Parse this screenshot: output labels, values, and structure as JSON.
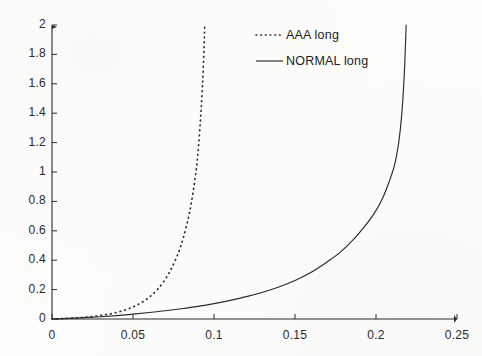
{
  "figure": {
    "background_color": "#fdfdfc",
    "ink_color": "#2b2b2b",
    "width": 482,
    "height": 356
  },
  "chart_data": {
    "type": "line",
    "title": "",
    "subtitle": "",
    "xlabel": "",
    "ylabel": "",
    "xlim": [
      0,
      0.25
    ],
    "ylim": [
      0,
      2
    ],
    "grid": false,
    "legend_position": "top-center",
    "xticks": [
      0,
      0.05,
      0.1,
      0.15,
      0.2,
      0.25
    ],
    "xtick_labels": [
      "0",
      "0.05",
      "0.1",
      "0.15",
      "0.2",
      "0.25"
    ],
    "yticks": [
      0,
      0.2,
      0.4,
      0.6,
      0.8,
      1,
      1.2,
      1.4,
      1.6,
      1.8,
      2
    ],
    "ytick_labels": [
      "0",
      "0.2",
      "0.4",
      "0.6",
      "0.8",
      "1",
      "1.2",
      "1.4",
      "1.6",
      "1.8",
      "2"
    ],
    "series": [
      {
        "name": "AAA long",
        "style": "dotted",
        "color": "#2b2b2b",
        "asymptote_x": 0.095,
        "x": [
          0.0,
          0.005,
          0.01,
          0.015,
          0.02,
          0.025,
          0.03,
          0.035,
          0.04,
          0.045,
          0.05,
          0.055,
          0.06,
          0.065,
          0.07,
          0.074,
          0.078,
          0.081,
          0.084,
          0.086,
          0.088,
          0.0895,
          0.0905,
          0.0915,
          0.0922,
          0.0928,
          0.0932,
          0.0936,
          0.0939,
          0.0941,
          0.0943
        ],
        "y": [
          0.0,
          0.002,
          0.005,
          0.008,
          0.012,
          0.017,
          0.024,
          0.033,
          0.045,
          0.061,
          0.082,
          0.11,
          0.148,
          0.2,
          0.272,
          0.35,
          0.45,
          0.55,
          0.68,
          0.79,
          0.93,
          1.06,
          1.18,
          1.33,
          1.45,
          1.57,
          1.66,
          1.76,
          1.85,
          1.93,
          2.0
        ]
      },
      {
        "name": "NORMAL long",
        "style": "solid",
        "color": "#2b2b2b",
        "asymptote_x": 0.222,
        "x": [
          0.0,
          0.01,
          0.02,
          0.03,
          0.04,
          0.05,
          0.06,
          0.07,
          0.08,
          0.09,
          0.1,
          0.11,
          0.12,
          0.13,
          0.14,
          0.15,
          0.16,
          0.17,
          0.178,
          0.186,
          0.193,
          0.199,
          0.204,
          0.208,
          0.2115,
          0.214,
          0.2158,
          0.217,
          0.2178,
          0.2183,
          0.2186
        ],
        "y": [
          0.0,
          0.004,
          0.009,
          0.015,
          0.023,
          0.033,
          0.044,
          0.056,
          0.07,
          0.086,
          0.105,
          0.127,
          0.152,
          0.182,
          0.218,
          0.262,
          0.318,
          0.39,
          0.455,
          0.54,
          0.63,
          0.72,
          0.82,
          0.93,
          1.05,
          1.2,
          1.38,
          1.57,
          1.75,
          1.9,
          2.0
        ]
      }
    ]
  },
  "legend": {
    "entries": [
      {
        "label": "AAA long",
        "style": "dotted"
      },
      {
        "label": "NORMAL long",
        "style": "solid"
      }
    ]
  }
}
